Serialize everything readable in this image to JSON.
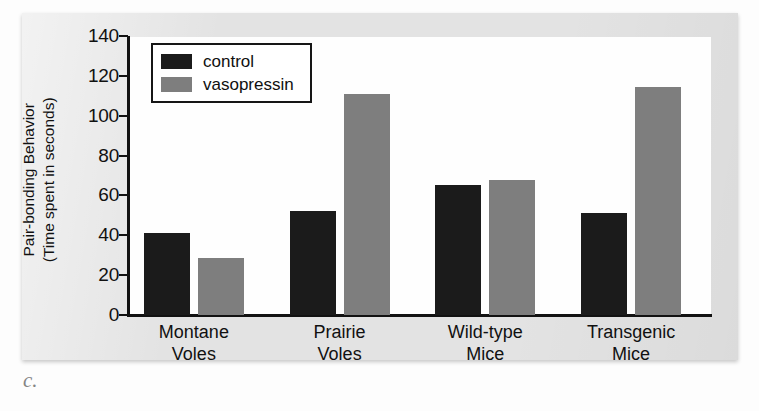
{
  "figure": {
    "letter": "c."
  },
  "chart_data": {
    "type": "bar",
    "title": "",
    "xlabel": "",
    "ylabel": "Pair-bonding Behavior (Time spent in seconds)",
    "ylabel_lines": [
      "Pair-bonding Behavior",
      "(Time spent in seconds)"
    ],
    "categories": [
      "Montane Voles",
      "Prairie Voles",
      "Wild-type Mice",
      "Transgenic Mice"
    ],
    "category_lines": [
      [
        "Montane",
        "Voles"
      ],
      [
        "Prairie",
        "Voles"
      ],
      [
        "Wild-type",
        "Mice"
      ],
      [
        "Transgenic",
        "Mice"
      ]
    ],
    "series": [
      {
        "name": "control",
        "color": "#1b1b1b",
        "values": [
          41,
          52,
          65,
          51
        ]
      },
      {
        "name": "vasopressin",
        "color": "#7e7e7e",
        "values": [
          28.5,
          111,
          67.5,
          114.5
        ]
      }
    ],
    "ylim": [
      0,
      140
    ],
    "yticks": [
      0,
      20,
      40,
      60,
      80,
      100,
      120,
      140
    ],
    "ytick_labels": [
      "0",
      "20",
      "40",
      "60",
      "80",
      "100",
      "120",
      "140"
    ],
    "grid": false,
    "legend_position": "top-left"
  }
}
